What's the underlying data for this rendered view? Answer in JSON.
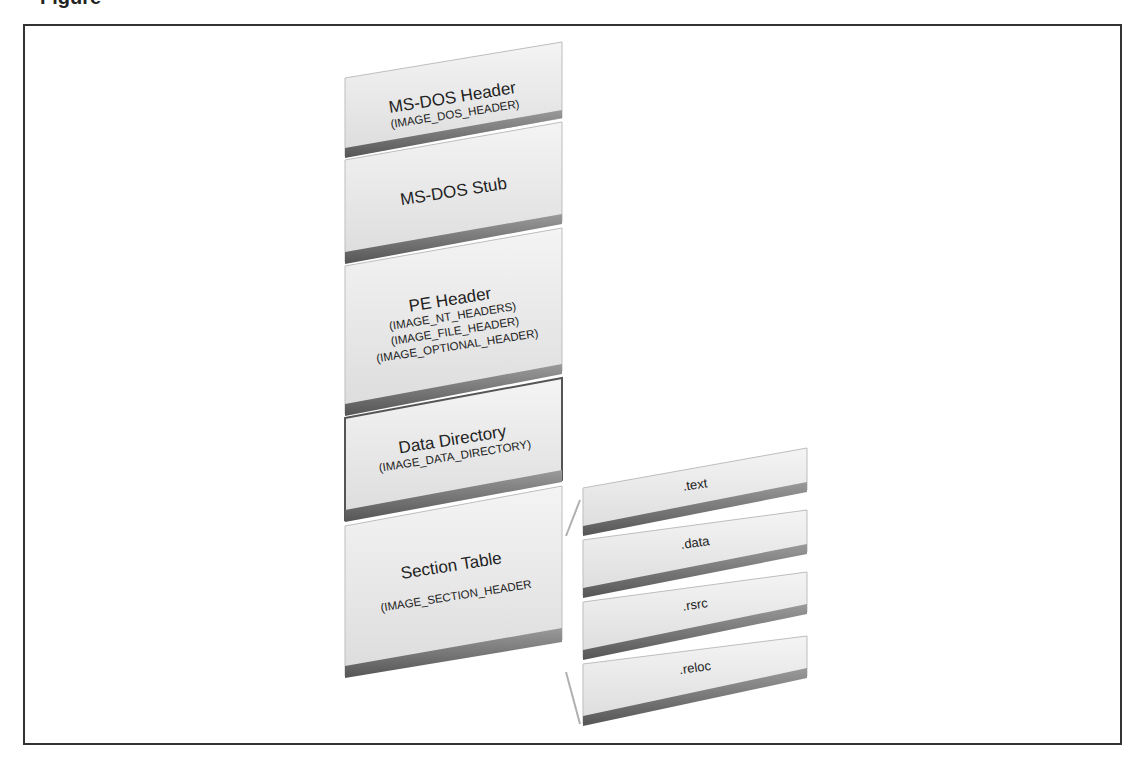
{
  "figure": {
    "caption_partial": "Figure"
  },
  "stack": [
    {
      "id": "dos-header",
      "title": "MS-DOS Header",
      "sub": [
        "(IMAGE_DOS_HEADER)"
      ]
    },
    {
      "id": "dos-stub",
      "title": "MS-DOS Stub",
      "sub": []
    },
    {
      "id": "pe-header",
      "title": "PE Header",
      "sub": [
        "(IMAGE_NT_HEADERS)",
        "(IMAGE_FILE_HEADER)",
        "(IMAGE_OPTIONAL_HEADER)"
      ]
    },
    {
      "id": "data-directory",
      "title": "Data Directory",
      "sub": [
        "(IMAGE_DATA_DIRECTORY)"
      ]
    },
    {
      "id": "section-table",
      "title": "Section Table",
      "sub": [
        "(IMAGE_SECTION_HEADER"
      ]
    }
  ],
  "sections": [
    {
      "id": "text",
      "label": ".text"
    },
    {
      "id": "data",
      "label": ".data"
    },
    {
      "id": "rsrc",
      "label": ".rsrc"
    },
    {
      "id": "reloc",
      "label": ".reloc"
    }
  ],
  "colors": {
    "frame": "#333333",
    "box_face": "#e6e6e6",
    "box_shadow": "#6e6e6e",
    "box_highlight": "#f8f8f8",
    "data_directory_border": "#555555",
    "connector": "#b0b0b0"
  }
}
